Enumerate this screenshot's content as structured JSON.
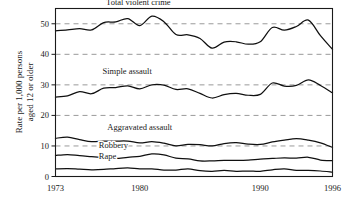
{
  "chart_data": {
    "type": "line",
    "title": "",
    "xlabel": "",
    "ylabel": "Rate per 1,000 persons aged 12 or older",
    "ylabel_line1": "Rate per 1,000 persons",
    "ylabel_line2": "aged 12 or older",
    "xlim": [
      1973,
      1996
    ],
    "ylim": [
      0,
      55
    ],
    "grid": true,
    "gridlines": [
      10,
      20,
      30,
      40,
      50
    ],
    "legend_position": "inline-labels",
    "xticks": [
      1973,
      1980,
      1990,
      1996
    ],
    "xtick_labels": [
      "1973",
      "1980",
      "1990",
      "1996"
    ],
    "yticks": [
      0,
      10,
      20,
      30,
      40,
      50
    ],
    "ytick_labels": [
      "0",
      "10",
      "20",
      "30",
      "40",
      "50"
    ],
    "x": [
      1973,
      1974,
      1975,
      1976,
      1977,
      1978,
      1979,
      1980,
      1981,
      1982,
      1983,
      1984,
      1985,
      1986,
      1987,
      1988,
      1989,
      1990,
      1991,
      1992,
      1993,
      1994,
      1995,
      1996
    ],
    "series": [
      {
        "name": "Total violent crime",
        "label": "Total violent crime",
        "label_x": 1977.2,
        "label_y": 56.0,
        "values": [
          47.7,
          48.0,
          48.4,
          48.0,
          50.4,
          50.6,
          51.7,
          49.4,
          52.5,
          50.7,
          46.5,
          46.4,
          45.2,
          42.0,
          44.0,
          44.1,
          43.3,
          44.1,
          48.8,
          47.9,
          49.1,
          51.2,
          46.1,
          41.6
        ]
      },
      {
        "name": "Simple assault",
        "label": "Simple assault",
        "label_x": 1976.9,
        "label_y": 33.4,
        "values": [
          26.0,
          26.4,
          27.8,
          27.1,
          28.9,
          29.1,
          29.7,
          28.7,
          30.0,
          29.9,
          28.5,
          28.7,
          27.2,
          25.7,
          26.8,
          27.2,
          26.6,
          26.9,
          30.6,
          29.6,
          29.8,
          31.6,
          29.8,
          27.4
        ]
      },
      {
        "name": "Aggravated assault",
        "label": "Aggravated assault",
        "label_x": 1977.3,
        "label_y": 15.3,
        "values": [
          12.5,
          12.9,
          12.1,
          11.4,
          11.6,
          11.6,
          11.6,
          11.0,
          11.4,
          10.9,
          10.0,
          10.5,
          10.4,
          10.0,
          10.8,
          11.1,
          10.6,
          10.5,
          11.3,
          11.9,
          12.4,
          11.9,
          11.0,
          9.5
        ]
      },
      {
        "name": "Robbery",
        "label": "Robbery",
        "label_x": 1976.6,
        "label_y": 9.3,
        "values": [
          6.9,
          7.2,
          6.8,
          6.5,
          6.2,
          5.9,
          6.3,
          6.6,
          7.4,
          7.1,
          6.0,
          5.8,
          5.1,
          5.1,
          5.3,
          5.3,
          5.4,
          5.7,
          5.9,
          6.1,
          6.0,
          6.3,
          5.4,
          5.2
        ]
      },
      {
        "name": "Rape",
        "label": "Rape",
        "label_x": 1976.6,
        "label_y": 5.6,
        "values": [
          2.5,
          2.6,
          2.4,
          2.2,
          2.3,
          2.6,
          2.8,
          2.5,
          2.5,
          2.1,
          2.1,
          2.5,
          1.9,
          1.7,
          2.0,
          1.7,
          1.8,
          1.7,
          2.2,
          2.5,
          2.0,
          2.0,
          1.8,
          1.4
        ]
      }
    ]
  }
}
